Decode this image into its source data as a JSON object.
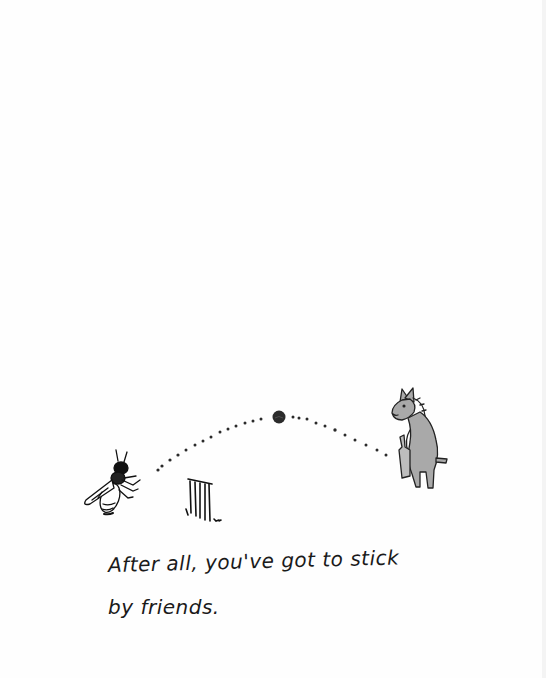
{
  "illustration": {
    "characters": [
      {
        "name": "bee",
        "role": "bowler"
      },
      {
        "name": "donkey",
        "role": "batter",
        "holding": "cricket bat"
      }
    ],
    "objects": [
      "cricket ball",
      "wicket stumps",
      "dotted ball trajectory"
    ],
    "colors": {
      "ink": "#1a1a1a",
      "donkey_fill": "#a9a9a9",
      "background": "#fefefe"
    }
  },
  "caption": {
    "line1": "After all, you've got to stick",
    "line2": "by friends."
  }
}
